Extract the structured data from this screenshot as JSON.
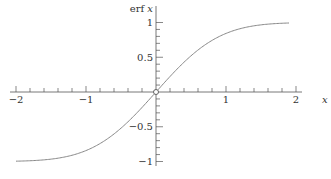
{
  "chart_data": {
    "type": "line",
    "title": "",
    "xlabel": "x",
    "ylabel": "erf x",
    "xlim": [
      -2,
      2
    ],
    "ylim": [
      -1,
      1
    ],
    "x_ticks": [
      -2,
      -1,
      1,
      2
    ],
    "x_tick_labels": [
      "-2",
      "-1",
      "1",
      "2"
    ],
    "x_minor_step": 0.2,
    "y_ticks": [
      1,
      0.5,
      -0.5,
      -1
    ],
    "y_tick_labels": [
      "1",
      "0.5",
      "-0.5",
      "-1"
    ],
    "y_minor_step": 0.1,
    "grid": false,
    "legend": null,
    "series": [
      {
        "name": "erf x",
        "color": "#888888",
        "x": [
          -2.0,
          -1.8,
          -1.6,
          -1.4,
          -1.2,
          -1.0,
          -0.8,
          -0.6,
          -0.4,
          -0.2,
          0.0,
          0.2,
          0.4,
          0.6,
          0.8,
          1.0,
          1.2,
          1.4,
          1.6,
          1.8,
          1.9
        ],
        "values": [
          -0.995,
          -0.989,
          -0.976,
          -0.952,
          -0.91,
          -0.843,
          -0.742,
          -0.604,
          -0.428,
          -0.223,
          0.0,
          0.223,
          0.428,
          0.604,
          0.742,
          0.843,
          0.91,
          0.952,
          0.976,
          0.989,
          0.993
        ]
      }
    ],
    "annotations": [
      {
        "type": "open-circle",
        "x": 0,
        "y": 0
      }
    ]
  }
}
